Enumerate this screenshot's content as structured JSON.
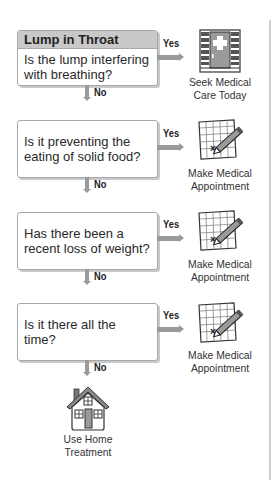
{
  "title": "Lump in Throat",
  "steps": [
    {
      "question": "Is the lump interfering with breathing?",
      "question_lines": [
        "Is the lump interfering",
        "with breathing?"
      ],
      "yes_label": "Yes",
      "no_label": "No",
      "yes_outcome": {
        "icon": "hospital-icon",
        "lines": [
          "Seek Medical",
          "Care Today"
        ]
      }
    },
    {
      "question": "Is it preventing the eating of solid food?",
      "question_lines": [
        "Is it preventing the",
        "eating of solid food?"
      ],
      "yes_label": "Yes",
      "no_label": "No",
      "yes_outcome": {
        "icon": "calendar-pencil-icon",
        "lines": [
          "Make Medical",
          "Appointment"
        ]
      }
    },
    {
      "question": "Has there been a recent loss of weight?",
      "question_lines": [
        "Has there been a",
        "recent loss of weight?"
      ],
      "yes_label": "Yes",
      "no_label": "No",
      "yes_outcome": {
        "icon": "calendar-pencil-icon",
        "lines": [
          "Make Medical",
          "Appointment"
        ]
      }
    },
    {
      "question": "Is it there all the time?",
      "question_lines": [
        "Is it there all the time?"
      ],
      "yes_label": "Yes",
      "no_label": "No",
      "yes_outcome": {
        "icon": "calendar-pencil-icon",
        "lines": [
          "Make Medical",
          "Appointment"
        ]
      }
    }
  ],
  "final_outcome": {
    "icon": "house-icon",
    "lines": [
      "Use Home",
      "Treatment"
    ]
  },
  "colors": {
    "header_bg": "#c9c9c9",
    "arrow": "#9a9a9a",
    "border": "#a8a8a8"
  }
}
